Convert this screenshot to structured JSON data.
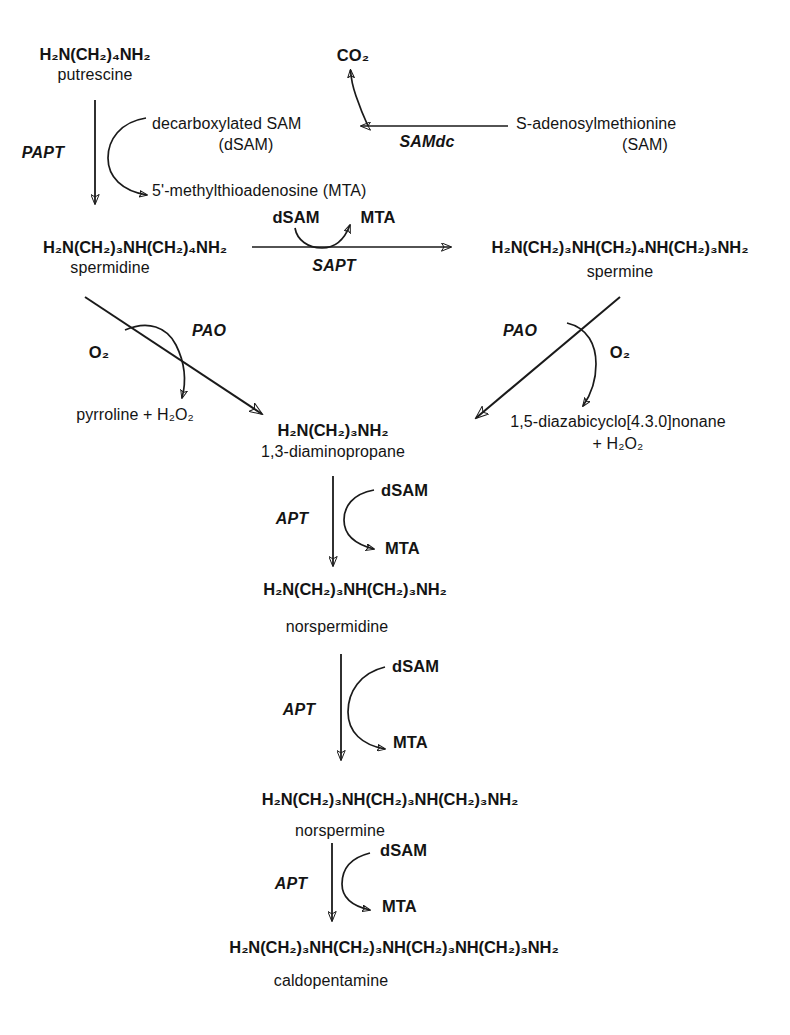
{
  "diagram": {
    "stroke_color": "#1a1a1a",
    "background": "#ffffff"
  },
  "metabolites": {
    "putrescine_formula": "H₂N(CH₂)₄NH₂",
    "putrescine_name": "putrescine",
    "dsam_label": "decarboxylated SAM",
    "dsam_abbrev": "(dSAM)",
    "sam_label": "S-adenosylmethionine",
    "sam_abbrev": "(SAM)",
    "co2": "CO₂",
    "mta_full": "5'-methylthioadenosine (MTA)",
    "spermidine_formula": "H₂N(CH₂)₃NH(CH₂)₄NH₂",
    "spermidine_name": "spermidine",
    "spermine_formula": "H₂N(CH₂)₃NH(CH₂)₄NH(CH₂)₃NH₂",
    "spermine_name": "spermine",
    "oxygen": "O₂",
    "pyrroline_products": "pyrroline + H₂O₂",
    "diazabicyclo_products_line1": "1,5-diazabicyclo[4.3.0]nonane",
    "diazabicyclo_products_line2": "+ H₂O₂",
    "diaminopropane_formula": "H₂N(CH₂)₃NH₂",
    "diaminopropane_name": "1,3-diaminopropane",
    "norspermidine_formula": "H₂N(CH₂)₃NH(CH₂)₃NH₂",
    "norspermidine_name": "norspermidine",
    "norspermine_formula": "H₂N(CH₂)₃NH(CH₂)₃NH(CH₂)₃NH₂",
    "norspermine_name": "norspermine",
    "caldopentamine_formula": "H₂N(CH₂)₃NH(CH₂)₃NH(CH₂)₃NH(CH₂)₃NH₂",
    "caldopentamine_name": "caldopentamine"
  },
  "cofactors": {
    "dsam": "dSAM",
    "mta": "MTA"
  },
  "enzymes": {
    "papt": "PAPT",
    "samdc": "SAMdc",
    "sapt": "SAPT",
    "pao_left": "PAO",
    "pao_right": "PAO",
    "apt_1": "APT",
    "apt_2": "APT",
    "apt_3": "APT"
  },
  "steps": [
    {
      "id": "samdc-step",
      "substrate": "S-adenosylmethionine",
      "product": "decarboxylated SAM",
      "enzyme": "SAMdc",
      "released": "CO₂",
      "direction": "right-to-left"
    },
    {
      "id": "papt-step",
      "substrate": "putrescine",
      "product": "spermidine",
      "enzyme": "PAPT",
      "consumed": "decarboxylated SAM",
      "released": "5'-methylthioadenosine (MTA)",
      "direction": "downward"
    },
    {
      "id": "sapt-step",
      "substrate": "spermidine",
      "product": "spermine",
      "enzyme": "SAPT",
      "consumed": "dSAM",
      "released": "MTA",
      "direction": "left-to-right"
    },
    {
      "id": "pao-left-step",
      "substrate": "spermidine",
      "product": "1,3-diaminopropane",
      "enzyme": "PAO",
      "consumed": "O₂",
      "released": "pyrroline + H₂O₂",
      "direction": "diagonal-down-right"
    },
    {
      "id": "pao-right-step",
      "substrate": "spermine",
      "product": "1,3-diaminopropane",
      "enzyme": "PAO",
      "consumed": "O₂",
      "released": "1,5-diazabicyclo[4.3.0]nonane + H₂O₂",
      "direction": "diagonal-down-left"
    },
    {
      "id": "apt-step-1",
      "substrate": "1,3-diaminopropane",
      "product": "norspermidine",
      "enzyme": "APT",
      "consumed": "dSAM",
      "released": "MTA",
      "direction": "downward"
    },
    {
      "id": "apt-step-2",
      "substrate": "norspermidine",
      "product": "norspermine",
      "enzyme": "APT",
      "consumed": "dSAM",
      "released": "MTA",
      "direction": "downward"
    },
    {
      "id": "apt-step-3",
      "substrate": "norspermine",
      "product": "caldopentamine",
      "enzyme": "APT",
      "consumed": "dSAM",
      "released": "MTA",
      "direction": "downward"
    }
  ]
}
